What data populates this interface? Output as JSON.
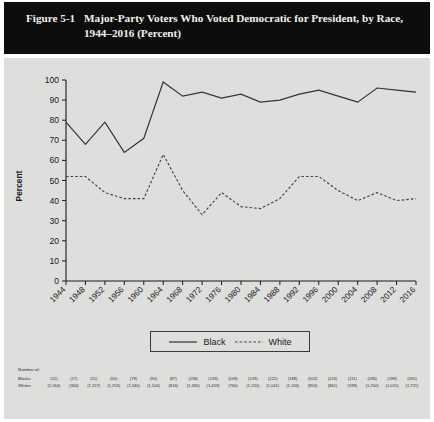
{
  "figure": {
    "number": "Figure 5-1",
    "title": "Major-Party Voters Who Voted Democratic for President, by Race, 1944–2016 (Percent)"
  },
  "legend": {
    "black_label": "Black",
    "white_label": "White"
  },
  "ntable": {
    "caption": "Number of:",
    "row_black_label": "Blacks",
    "row_white_label": "Whites",
    "black_counts": [
      "(52)",
      "(17)",
      "(51)",
      "(50)",
      "(79)",
      "(94)",
      "(87)",
      "(138)",
      "(133)",
      "(109)",
      "(129)",
      "(122)",
      "(188)",
      "(102)",
      "(123)",
      "(111)",
      "(196)",
      "(189)",
      "(265)"
    ],
    "white_counts": [
      "(1,564)",
      "(364)",
      "(1,257)",
      "(1,253)",
      "(1,340)",
      "(1,104)",
      "(816)",
      "(1,430)",
      "(1,459)",
      "(760)",
      "(1,220)",
      "(1,041)",
      "(1,134)",
      "(900)",
      "(861)",
      "(599)",
      "(1,250)",
      "(1,021)",
      "(1,721)"
    ]
  },
  "colors": {
    "title_bar": "#0d0d0d",
    "title_text": "#f2f0ec",
    "panel_bg": "#dededd",
    "line": "#333333",
    "axis": "#1a1a1a"
  },
  "chart_data": {
    "type": "line",
    "title": "Major-Party Voters Who Voted Democratic for President, by Race, 1944–2016 (Percent)",
    "xlabel": "Election Year",
    "ylabel": "Percent",
    "ylim": [
      0,
      100
    ],
    "ytick_step": 10,
    "yticks": [
      0,
      10,
      20,
      30,
      40,
      50,
      60,
      70,
      80,
      90,
      100
    ],
    "grid": false,
    "legend_position": "bottom-center",
    "categories": [
      1944,
      1948,
      1952,
      1956,
      1960,
      1964,
      1968,
      1972,
      1976,
      1980,
      1984,
      1988,
      1992,
      1996,
      2000,
      2004,
      2008,
      2012,
      2016
    ],
    "xtick_labels": [
      "1944",
      "1948",
      "1952",
      "1956",
      "1960",
      "1964",
      "1968",
      "1972",
      "1976",
      "1980",
      "1984",
      "1988",
      "1992",
      "1996",
      "2000",
      "2004",
      "2008",
      "2012",
      "2016"
    ],
    "series": [
      {
        "name": "Black",
        "style": "solid",
        "values": [
          79,
          68,
          79,
          64,
          71,
          99,
          92,
          94,
          91,
          93,
          89,
          90,
          93,
          95,
          92,
          89,
          96,
          95,
          94
        ]
      },
      {
        "name": "White",
        "style": "dotted",
        "values": [
          52,
          52,
          44,
          41,
          41,
          63,
          45,
          33,
          44,
          37,
          36,
          41,
          52,
          52,
          45,
          40,
          44,
          40,
          41
        ]
      }
    ]
  }
}
